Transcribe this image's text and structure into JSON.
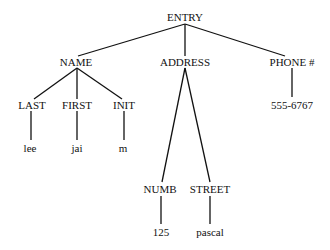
{
  "diagram": {
    "type": "tree",
    "root": "ENTRY",
    "nodes": [
      {
        "id": "entry",
        "label": "ENTRY",
        "x": 185,
        "y": 17
      },
      {
        "id": "name",
        "label": "NAME",
        "x": 76,
        "y": 62
      },
      {
        "id": "address",
        "label": "ADDRESS",
        "x": 185,
        "y": 62
      },
      {
        "id": "phone",
        "label": "PHONE #",
        "x": 292,
        "y": 62
      },
      {
        "id": "last",
        "label": "LAST",
        "x": 32,
        "y": 105
      },
      {
        "id": "first",
        "label": "FIRST",
        "x": 77,
        "y": 105
      },
      {
        "id": "init",
        "label": "INIT",
        "x": 124,
        "y": 105
      },
      {
        "id": "phone_val",
        "label": "555-6767",
        "x": 292,
        "y": 105
      },
      {
        "id": "lee",
        "label": "lee",
        "x": 30,
        "y": 148
      },
      {
        "id": "jai",
        "label": "jai",
        "x": 77,
        "y": 148
      },
      {
        "id": "m",
        "label": "m",
        "x": 123,
        "y": 148
      },
      {
        "id": "numb",
        "label": "NUMB",
        "x": 161,
        "y": 189
      },
      {
        "id": "street",
        "label": "STREET",
        "x": 211,
        "y": 189
      },
      {
        "id": "numb_val",
        "label": "125",
        "x": 161,
        "y": 232
      },
      {
        "id": "street_val",
        "label": "pascal",
        "x": 211,
        "y": 232
      }
    ],
    "edges": [
      [
        "entry",
        "name"
      ],
      [
        "entry",
        "address"
      ],
      [
        "entry",
        "phone"
      ],
      [
        "name",
        "last"
      ],
      [
        "name",
        "first"
      ],
      [
        "name",
        "init"
      ],
      [
        "phone",
        "phone_val"
      ],
      [
        "last",
        "lee"
      ],
      [
        "first",
        "jai"
      ],
      [
        "init",
        "m"
      ],
      [
        "address",
        "numb"
      ],
      [
        "address",
        "street"
      ],
      [
        "numb",
        "numb_val"
      ],
      [
        "street",
        "street_val"
      ]
    ]
  },
  "labels": {
    "entry": "ENTRY",
    "name": "NAME",
    "address": "ADDRESS",
    "phone": "PHONE #",
    "last": "LAST",
    "first": "FIRST",
    "init": "INIT",
    "phone_val": "555-6767",
    "lee": "lee",
    "jai": "jai",
    "m": "m",
    "numb": "NUMB",
    "street": "STREET",
    "numb_val": "125",
    "street_val": "pascal"
  },
  "colors": {
    "line": "#111111",
    "text": "#111111",
    "background": "#ffffff"
  }
}
